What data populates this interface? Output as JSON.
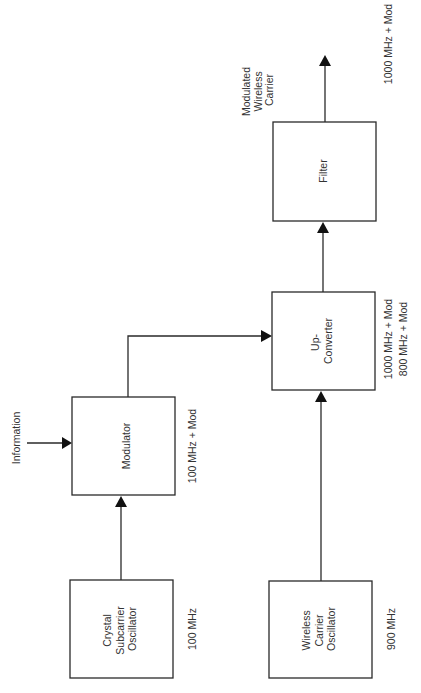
{
  "diagram": {
    "title": "",
    "orientation": "rotated-90-ccw",
    "colors": {
      "line": "#2a2a2a",
      "text": "#333333",
      "background": "#ffffff"
    },
    "blocks": [
      {
        "id": "crystal",
        "lines": [
          "Crystal",
          "Subcarrier",
          "Oscillator"
        ],
        "freq_label": "100 MHz"
      },
      {
        "id": "modulator",
        "lines": [
          "Modulator"
        ],
        "freq_label": "100 MHz + Mod"
      },
      {
        "id": "wireless",
        "lines": [
          "Wireless",
          "Carrier",
          "Oscillator"
        ],
        "freq_label": "900 MHz"
      },
      {
        "id": "upconverter",
        "lines": [
          "Up-",
          "Converter"
        ],
        "freq_labels": [
          "1000 MHz + Mod",
          "800 MHz + Mod"
        ]
      },
      {
        "id": "filter",
        "lines": [
          "Filter"
        ],
        "freq_label": "1000 MHz + Mod"
      }
    ],
    "inputs": {
      "information": "Information"
    },
    "outputs": {
      "carrier": [
        "Modulated",
        "Wireless",
        "Carrier"
      ]
    },
    "edges": [
      {
        "from": "information",
        "to": "modulator"
      },
      {
        "from": "crystal",
        "to": "modulator"
      },
      {
        "from": "modulator",
        "to": "upconverter"
      },
      {
        "from": "wireless",
        "to": "upconverter"
      },
      {
        "from": "upconverter",
        "to": "filter"
      },
      {
        "from": "filter",
        "to": "output"
      }
    ]
  }
}
